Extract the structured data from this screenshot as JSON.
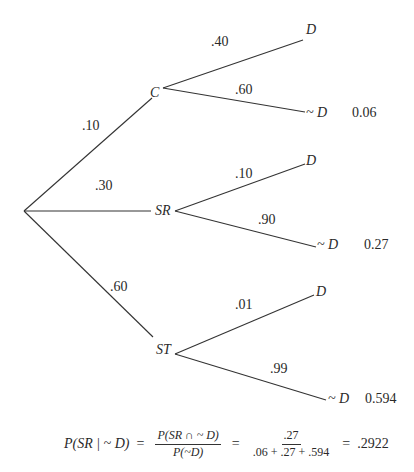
{
  "diagram": {
    "type": "probability-tree",
    "root": {
      "id": "root"
    },
    "first_level": [
      {
        "id": "C",
        "label": "C",
        "edge_prob": ".10"
      },
      {
        "id": "SR",
        "label": "SR",
        "edge_prob": ".30"
      },
      {
        "id": "ST",
        "label": "ST",
        "edge_prob": ".60"
      }
    ],
    "second_level": {
      "C": [
        {
          "label": "D",
          "edge_prob": ".40",
          "joint": ""
        },
        {
          "label": "~ D",
          "edge_prob": ".60",
          "joint": "0.06"
        }
      ],
      "SR": [
        {
          "label": "D",
          "edge_prob": ".10",
          "joint": ""
        },
        {
          "label": "~ D",
          "edge_prob": ".90",
          "joint": "0.27"
        }
      ],
      "ST": [
        {
          "label": "D",
          "edge_prob": ".01",
          "joint": ""
        },
        {
          "label": "~ D",
          "edge_prob": ".99",
          "joint": "0.594"
        }
      ]
    },
    "formula": {
      "lhs": "P(SR | ~ D)",
      "eq1": "=",
      "frac1_num": "P(SR ∩ ~ D)",
      "frac1_den": "P(~D)",
      "eq2": "=",
      "frac2_num": ".27",
      "frac2_den": ".06 + .27 + .594",
      "eq3": "=",
      "result": ".2922"
    },
    "colors": {
      "line": "#333333",
      "text": "#2a2a2a",
      "background": "#ffffff"
    }
  }
}
